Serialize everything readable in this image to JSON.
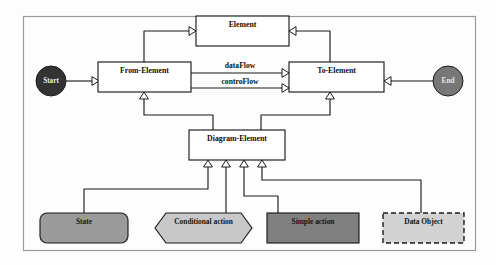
{
  "diagram": {
    "frame": {
      "name": "outer-frame",
      "stroke": "#9a9a9a"
    },
    "colors": {
      "class_fill": "#ffffff",
      "line": "#1b1b1b",
      "start_fill": "#333333",
      "end_fill": "#777777",
      "state_fill": "#9a9a9a",
      "conditional_fill": "#c8c8c8",
      "simple_action_fill": "#808080",
      "data_object_fill": "#d2d2d2",
      "terminator_text": "#e9e9e9",
      "shape_text": "#151515"
    },
    "classes": [
      {
        "id": "element",
        "label": "Element",
        "x": 196,
        "y": 16,
        "w": 93,
        "h": 30
      },
      {
        "id": "from_element",
        "label": "From-Element",
        "x": 98,
        "y": 62,
        "w": 93,
        "h": 30
      },
      {
        "id": "to_element",
        "label": "To-Element",
        "x": 289,
        "y": 62,
        "w": 95,
        "h": 30
      },
      {
        "id": "diagram_element",
        "label": "Diagram-Element",
        "x": 189,
        "y": 130,
        "w": 96,
        "h": 30
      }
    ],
    "terminators": [
      {
        "id": "start",
        "label": "Start",
        "cx": 51,
        "cy": 81,
        "r": 15,
        "fill": "#333333"
      },
      {
        "id": "end",
        "label": "End",
        "cx": 448,
        "cy": 81,
        "r": 15,
        "fill": "#777777"
      }
    ],
    "shapes": [
      {
        "id": "state",
        "label": "State",
        "kind": "rounded-rect",
        "x": 40,
        "y": 213,
        "w": 88,
        "h": 30,
        "fill": "#9a9a9a"
      },
      {
        "id": "conditional_action",
        "label": "Conditional action",
        "kind": "hexagon",
        "x": 155,
        "y": 213,
        "w": 97,
        "h": 30,
        "fill": "#c8c8c8"
      },
      {
        "id": "simple_action",
        "label": "Simple action",
        "kind": "rect",
        "x": 267,
        "y": 213,
        "w": 92,
        "h": 30,
        "fill": "#808080"
      },
      {
        "id": "data_object",
        "label": "Data Object",
        "kind": "dashed-rect",
        "x": 383,
        "y": 213,
        "w": 81,
        "h": 30,
        "fill": "#d2d2d2"
      }
    ],
    "edge_labels": [
      {
        "id": "data_flow",
        "label": "dataFlow",
        "x": 240,
        "y": 66
      },
      {
        "id": "contro_flow",
        "label": "controFlow",
        "x": 240,
        "y": 84
      }
    ],
    "relations": [
      {
        "id": "start-to-from",
        "from": "start",
        "to": "from_element",
        "kind": "association"
      },
      {
        "id": "end-to-to",
        "from": "end",
        "to": "to_element",
        "kind": "association"
      },
      {
        "id": "from-to-element",
        "from": "from_element",
        "to": "element",
        "kind": "generalization"
      },
      {
        "id": "to-to-element",
        "from": "to_element",
        "to": "element",
        "kind": "generalization"
      },
      {
        "id": "dataflow",
        "from": "from_element",
        "to": "to_element",
        "kind": "association"
      },
      {
        "id": "controflow",
        "from": "from_element",
        "to": "to_element",
        "kind": "association"
      },
      {
        "id": "diagram-to-from",
        "from": "diagram_element",
        "to": "from_element",
        "kind": "generalization"
      },
      {
        "id": "diagram-to-to",
        "from": "diagram_element",
        "to": "to_element",
        "kind": "generalization"
      },
      {
        "id": "state-to-diagram",
        "from": "state",
        "to": "diagram_element",
        "kind": "generalization"
      },
      {
        "id": "conditional-to-diagram",
        "from": "conditional_action",
        "to": "diagram_element",
        "kind": "generalization"
      },
      {
        "id": "simple-to-diagram",
        "from": "simple_action",
        "to": "diagram_element",
        "kind": "generalization"
      },
      {
        "id": "dataobject-to-diagram",
        "from": "data_object",
        "to": "diagram_element",
        "kind": "generalization"
      }
    ]
  }
}
